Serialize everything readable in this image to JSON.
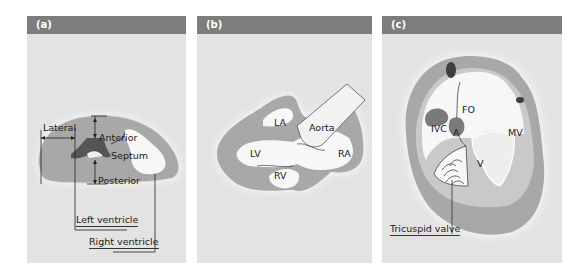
{
  "colors": {
    "header": "#7d7d7d",
    "panel_bg": "#e3e3e3",
    "myocardium": "#a8a8a8",
    "chamber": "#f7f7f7",
    "light_tissue": "#c9c9c9",
    "dark": "#555555"
  },
  "panels": [
    {
      "id": "a",
      "title": "(a)",
      "labels": {
        "lateral": "Lateral",
        "anterior": "Anterior",
        "septum": "Septum",
        "posterior": "Posterior",
        "left_ventricle": "Left ventricle",
        "right_ventricle": "Right ventricle"
      }
    },
    {
      "id": "b",
      "title": "(b)",
      "labels": {
        "la": "LA",
        "aorta": "Aorta",
        "lv": "LV",
        "ra": "RA",
        "rv": "RV"
      }
    },
    {
      "id": "c",
      "title": "(c)",
      "labels": {
        "fo": "FO",
        "ivc": "IVC",
        "a": "A",
        "mv": "MV",
        "v": "V",
        "tricuspid_valve": "Tricuspid valve"
      }
    }
  ]
}
